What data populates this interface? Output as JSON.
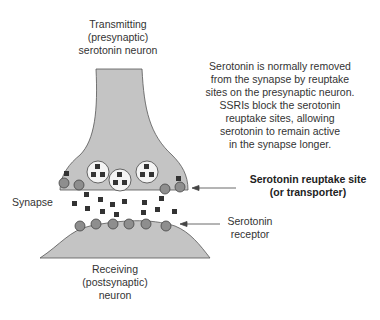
{
  "diagram": {
    "presynaptic_label": [
      "Transmitting",
      "(presynaptic)",
      "serotonin neuron"
    ],
    "explanation": [
      "Serotonin is normally removed",
      "from the synapse by reuptake",
      "sites on the presynaptic neuron.",
      "SSRIs block the serotonin",
      "reuptake sites, allowing",
      "serotonin to remain active",
      "in the synapse longer."
    ],
    "synapse_label": "Synapse",
    "reuptake_label": [
      "Serotonin reuptake site",
      "(or transporter)"
    ],
    "receptor_label": [
      "Serotonin",
      "receptor"
    ],
    "postsynaptic_label": [
      "Receiving",
      "(postsynaptic)",
      "neuron"
    ],
    "colors": {
      "neuron_fill": "#c4c4c4",
      "site_fill": "#8e8e8e",
      "molecule": "#3a3a3a",
      "outline": "#555555"
    }
  }
}
